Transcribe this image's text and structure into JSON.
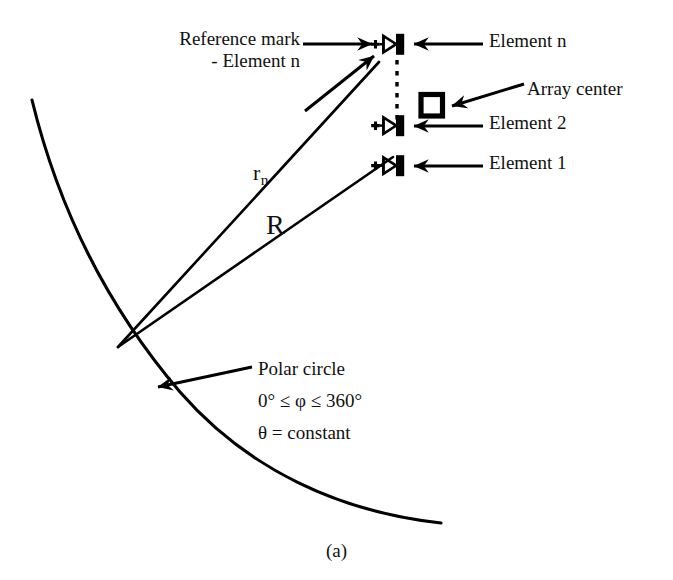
{
  "figure": {
    "caption": "(a)",
    "background_color": "#ffffff",
    "ink_color": "#000000"
  },
  "labels": {
    "reference_mark_line1": "Reference mark",
    "reference_mark_line2": "- Element n",
    "element_n": "Element n",
    "array_center": "Array center",
    "element_2": "Element 2",
    "element_1": "Element 1",
    "distance_rn": "r",
    "distance_rn_sub": "n",
    "distance_R": "R",
    "polar_circle": "Polar circle",
    "phi_range": "0° ≤ φ ≤ 360°",
    "theta_constant": "θ = constant"
  },
  "geometry": {
    "origin_point": {
      "x": 118,
      "y": 347
    },
    "arc": {
      "start": {
        "x": 32,
        "y": 100
      },
      "end": {
        "x": 441,
        "y": 523
      },
      "passes_through_origin": true
    },
    "elements": [
      {
        "name": "element-n",
        "x": 389,
        "y": 48,
        "label": "Element n"
      },
      {
        "name": "element-2",
        "x": 389,
        "y": 126,
        "label": "Element 2"
      },
      {
        "name": "element-1",
        "x": 389,
        "y": 166,
        "label": "Element 1"
      }
    ],
    "array_center_marker": {
      "x": 432,
      "y": 105
    },
    "dashed_line": {
      "x": 397,
      "y1": 58,
      "y2": 120
    },
    "ray_rn": {
      "from": {
        "x": 118,
        "y": 347
      },
      "to": {
        "x": 381,
        "y": 60
      }
    },
    "ray_R": {
      "from": {
        "x": 118,
        "y": 347
      },
      "to": {
        "x": 392,
        "y": 158
      }
    }
  },
  "arrows": [
    {
      "name": "arrow-to-reference-mark-horizontal",
      "from": {
        "x": 305,
        "y": 44
      },
      "to": {
        "x": 374,
        "y": 44
      }
    },
    {
      "name": "arrow-to-reference-mark-diagonal",
      "from": {
        "x": 306,
        "y": 110
      },
      "to": {
        "x": 377,
        "y": 54
      }
    },
    {
      "name": "arrow-to-element-n",
      "from": {
        "x": 482,
        "y": 44
      },
      "to": {
        "x": 414,
        "y": 44
      }
    },
    {
      "name": "arrow-to-array-center",
      "from": {
        "x": 523,
        "y": 85
      },
      "to": {
        "x": 452,
        "y": 106
      }
    },
    {
      "name": "arrow-to-element-2",
      "from": {
        "x": 482,
        "y": 126
      },
      "to": {
        "x": 414,
        "y": 126
      }
    },
    {
      "name": "arrow-to-element-1",
      "from": {
        "x": 482,
        "y": 166
      },
      "to": {
        "x": 414,
        "y": 166
      }
    },
    {
      "name": "arrow-to-polar-circle",
      "from": {
        "x": 250,
        "y": 368
      },
      "to": {
        "x": 156,
        "y": 388
      }
    }
  ]
}
